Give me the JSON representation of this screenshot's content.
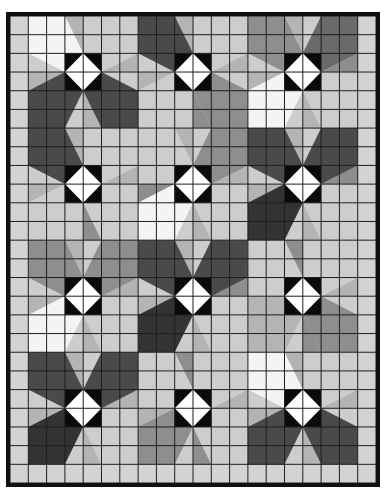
{
  "grid": {
    "cols": 20,
    "rows": 25
  },
  "palette": {
    "W": "#f4f4f4",
    "L": "#cdcdcd",
    "P": "#b4b4b4",
    "G": "#8e8e8e",
    "M": "#6a6a6a",
    "D": "#4a4a4a",
    "K": "#333333",
    "background": "#d3d3d3",
    "grid_line": "#1e1e1e",
    "center_square": "#0a0a0a",
    "center_diamond": "#ffffff"
  },
  "stars": [
    {
      "col": 3,
      "row": 2,
      "quadrants": {
        "TL": "W",
        "TR": "L",
        "BL": "D",
        "BR": "D"
      },
      "wedges": {
        "N": "P",
        "E": "P",
        "S": "P",
        "W": "P"
      }
    },
    {
      "col": 9,
      "row": 2,
      "quadrants": {
        "TL": "D",
        "TR": "L",
        "BL": "L",
        "BR": "G"
      },
      "wedges": {
        "N": "P",
        "E": "P",
        "S": "G",
        "W": "P"
      }
    },
    {
      "col": 15,
      "row": 2,
      "quadrants": {
        "TL": "G",
        "TR": "M",
        "BL": "W",
        "BR": "L"
      },
      "wedges": {
        "N": "P",
        "E": "G",
        "S": "P",
        "W": "P"
      }
    },
    {
      "col": 3,
      "row": 8,
      "quadrants": {
        "TL": "D",
        "TR": "L",
        "BL": "L",
        "BR": "L"
      },
      "wedges": {
        "N": "P",
        "E": "P",
        "S": "G",
        "W": "P"
      }
    },
    {
      "col": 9,
      "row": 8,
      "quadrants": {
        "TL": "L",
        "TR": "G",
        "BL": "W",
        "BR": "L"
      },
      "wedges": {
        "N": "P",
        "E": "P",
        "S": "P",
        "W": "G"
      }
    },
    {
      "col": 15,
      "row": 8,
      "quadrants": {
        "TL": "D",
        "TR": "D",
        "BL": "K",
        "BR": "L"
      },
      "wedges": {
        "N": "P",
        "E": "G",
        "S": "P",
        "W": "P"
      }
    },
    {
      "col": 3,
      "row": 14,
      "quadrants": {
        "TL": "G",
        "TR": "G",
        "BL": "W",
        "BR": "L"
      },
      "wedges": {
        "N": "P",
        "E": "P",
        "S": "P",
        "W": "P"
      }
    },
    {
      "col": 9,
      "row": 14,
      "quadrants": {
        "TL": "D",
        "TR": "D",
        "BL": "K",
        "BR": "L"
      },
      "wedges": {
        "N": "P",
        "E": "G",
        "S": "P",
        "W": "P"
      }
    },
    {
      "col": 15,
      "row": 14,
      "quadrants": {
        "TL": "L",
        "TR": "L",
        "BL": "P",
        "BR": "G"
      },
      "wedges": {
        "N": "G",
        "E": "P",
        "S": "G",
        "W": "P"
      }
    },
    {
      "col": 3,
      "row": 20,
      "quadrants": {
        "TL": "D",
        "TR": "D",
        "BL": "K",
        "BR": "L"
      },
      "wedges": {
        "N": "P",
        "E": "P",
        "S": "P",
        "W": "P"
      }
    },
    {
      "col": 9,
      "row": 20,
      "quadrants": {
        "TL": "L",
        "TR": "L",
        "BL": "G",
        "BR": "L"
      },
      "wedges": {
        "N": "G",
        "E": "P",
        "S": "G",
        "W": "P"
      }
    },
    {
      "col": 15,
      "row": 20,
      "quadrants": {
        "TL": "W",
        "TR": "L",
        "BL": "D",
        "BR": "D"
      },
      "wedges": {
        "N": "P",
        "E": "P",
        "S": "P",
        "W": "P"
      }
    }
  ],
  "patches": [
    {
      "col": 1,
      "row": 0,
      "w": 2,
      "h": 2,
      "shade": "W"
    },
    {
      "col": 12,
      "row": 11,
      "w": 1,
      "h": 2,
      "shade": "W"
    },
    {
      "col": 13,
      "row": 4,
      "w": 2,
      "h": 2,
      "shade": "W"
    },
    {
      "col": 7,
      "row": 10,
      "w": 2,
      "h": 2,
      "shade": "W"
    },
    {
      "col": 1,
      "row": 16,
      "w": 2,
      "h": 2,
      "shade": "W"
    },
    {
      "col": 13,
      "row": 18,
      "w": 2,
      "h": 2,
      "shade": "W"
    },
    {
      "col": 12,
      "row": 0,
      "w": 3,
      "h": 2,
      "shade": "P"
    },
    {
      "col": 17,
      "row": 0,
      "w": 2,
      "h": 2,
      "shade": "G"
    },
    {
      "col": 7,
      "row": 4,
      "w": 2,
      "h": 2,
      "shade": "P"
    },
    {
      "col": 1,
      "row": 6,
      "w": 2,
      "h": 2,
      "shade": "P"
    },
    {
      "col": 7,
      "row": 18,
      "w": 2,
      "h": 2,
      "shade": "P"
    },
    {
      "col": 13,
      "row": 22,
      "w": 2,
      "h": 2,
      "shade": "G"
    }
  ]
}
